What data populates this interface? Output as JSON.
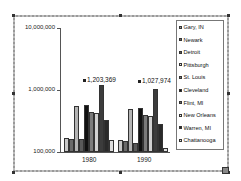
{
  "chart_data": {
    "type": "bar",
    "title": "",
    "xlabel": "",
    "ylabel": "",
    "yscale": "log",
    "ylim": [
      100000,
      10000000
    ],
    "yticks": [
      "100,000",
      "1,000,000",
      "10,000,000"
    ],
    "categories": [
      "1980",
      "1990"
    ],
    "legend_position": "right",
    "grid": false,
    "series": [
      {
        "name": "Gary, IN",
        "values": [
          170000,
          155000
        ],
        "color": "#c8c8c8"
      },
      {
        "name": "Newark",
        "values": [
          165000,
          148000
        ],
        "color": "#6a6a6a"
      },
      {
        "name": "Detroit",
        "values": [
          1203369,
          1027974
        ],
        "color": "#3c3c3c"
      },
      {
        "name": "Pittsburgh",
        "values": [
          560000,
          490000
        ],
        "color": "#b4b4b4"
      },
      {
        "name": "St. Louis",
        "values": [
          450000,
          395000
        ],
        "color": "#7a7a7a"
      },
      {
        "name": "Cleveland",
        "values": [
          570000,
          505000
        ],
        "color": "#111111"
      },
      {
        "name": "Flint, MI",
        "values": [
          160000,
          140000
        ],
        "color": "#5a5a5a"
      },
      {
        "name": "New Orleans",
        "values": [
          420000,
          380000
        ],
        "color": "#d0d0d0"
      },
      {
        "name": "Warren, MI",
        "values": [
          330000,
          280000
        ],
        "color": "#2a2a2a"
      },
      {
        "name": "Chattanooga",
        "values": [
          155000,
          115000
        ],
        "color": "#e0e0e0"
      }
    ],
    "annotations": [
      {
        "category": "1980",
        "series": "Detroit",
        "text": "1,203,369"
      },
      {
        "category": "1990",
        "series": "Detroit",
        "text": "1,027,974"
      }
    ]
  },
  "axis": {
    "y_labels": [
      "10,000,000",
      "1,000,000",
      "100,000"
    ],
    "x_labels": [
      "1980",
      "1990"
    ]
  },
  "annotations": {
    "a1980": "1,203,369",
    "a1990": "1,027,974"
  },
  "legend": {
    "items": [
      "Gary, IN",
      "Newark",
      "Detroit",
      "Pittsburgh",
      "St. Louis",
      "Cleveland",
      "Flint, MI",
      "New Orleans",
      "Warren, MI",
      "Chattanooga"
    ],
    "colors": [
      "#9a9a9a",
      "#6a6a6a",
      "#5a5a5a",
      "#e6e6e6",
      "#7a7a7a",
      "#111111",
      "#6a6a6a",
      "#eeeeee",
      "#2a2a2a",
      "#dddddd"
    ]
  }
}
